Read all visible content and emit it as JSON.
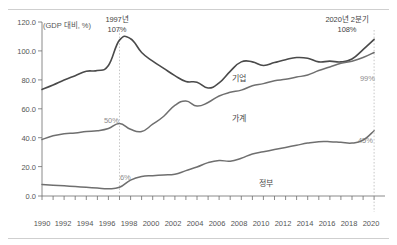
{
  "chart_data": {
    "type": "line",
    "title": "",
    "unit_label": "(GDP 대비, %)",
    "xlabel": "",
    "ylabel": "",
    "ylim": [
      0,
      120
    ],
    "yticks": [
      "0.0",
      "20.0",
      "40.0",
      "60.0",
      "80.0",
      "100.0",
      "120.0"
    ],
    "xlim": [
      1990,
      2020
    ],
    "xticks": [
      "1990",
      "1992",
      "1994",
      "1996",
      "1998",
      "2000",
      "2002",
      "2004",
      "2006",
      "2008",
      "2010",
      "2012",
      "2014",
      "2016",
      "2018",
      "2020"
    ],
    "grid": false,
    "legend_position": "inline-labels",
    "x": [
      1990,
      1991,
      1992,
      1993,
      1994,
      1995,
      1996,
      1997,
      1998,
      1999,
      2000,
      2001,
      2002,
      2003,
      2004,
      2005,
      2006,
      2007,
      2008,
      2009,
      2010,
      2011,
      2012,
      2013,
      2014,
      2015,
      2016,
      2017,
      2018,
      2019,
      2020
    ],
    "series": [
      {
        "name": "기업",
        "color": "#4a4a4a",
        "values": [
          73.5,
          76.5,
          80.0,
          83.0,
          86.0,
          86.5,
          90.0,
          107.5,
          108.5,
          99.0,
          93.0,
          88.0,
          83.0,
          79.0,
          78.5,
          74.5,
          78.0,
          86.0,
          92.5,
          92.5,
          90.0,
          92.0,
          94.0,
          95.5,
          95.0,
          92.5,
          93.0,
          92.5,
          94.5,
          101.0,
          108.0
        ]
      },
      {
        "name": "가계",
        "color": "#6f6f6f",
        "values": [
          39.0,
          41.5,
          43.0,
          43.5,
          44.5,
          45.0,
          46.5,
          50.0,
          46.0,
          44.5,
          49.5,
          55.0,
          62.5,
          65.5,
          62.0,
          64.5,
          69.0,
          71.5,
          73.0,
          76.0,
          77.5,
          79.5,
          80.5,
          82.0,
          83.5,
          86.5,
          89.0,
          91.5,
          93.0,
          95.5,
          99.0
        ]
      },
      {
        "name": "정부",
        "color": "#6f6f6f",
        "values": [
          8.0,
          7.5,
          7.0,
          6.5,
          6.0,
          5.5,
          5.0,
          6.0,
          11.0,
          13.5,
          14.0,
          14.5,
          15.0,
          17.5,
          20.0,
          23.0,
          24.5,
          24.0,
          26.0,
          29.0,
          30.5,
          32.0,
          33.5,
          35.0,
          36.5,
          37.5,
          37.5,
          37.0,
          36.5,
          38.5,
          45.0
        ]
      }
    ],
    "reference_lines": [
      {
        "x": 1997,
        "style": "dotted"
      },
      {
        "x": 2020,
        "style": "dotted"
      }
    ],
    "annotations": [
      {
        "id": "peak-1997",
        "text_line1": "1997년",
        "text_line2": "107%",
        "x": 1997
      },
      {
        "id": "latest-2020",
        "text_line1": "2020년 2분기",
        "text_line2": "108%",
        "x": 2020
      },
      {
        "id": "household-1997",
        "text": "50%",
        "x": 1997
      },
      {
        "id": "government-1997",
        "text": "6%",
        "x": 1997
      },
      {
        "id": "household-2020",
        "text": "99%",
        "x": 2020
      },
      {
        "id": "government-2020",
        "text": "45%",
        "x": 2020
      }
    ]
  },
  "labels": {
    "y": {
      "t120": "120.0",
      "t100": "100.0",
      "t80": "80.0",
      "t60": "60.0",
      "t40": "40.0",
      "t20": "20.0",
      "t0": "0.0"
    },
    "x": {
      "y1990": "1990",
      "y1992": "1992",
      "y1994": "1994",
      "y1996": "1996",
      "y1998": "1998",
      "y2000": "2000",
      "y2002": "2002",
      "y2004": "2004",
      "y2006": "2006",
      "y2008": "2008",
      "y2010": "2010",
      "y2012": "2012",
      "y2014": "2014",
      "y2016": "2016",
      "y2018": "2018",
      "y2020": "2020"
    },
    "unit": "(GDP 대비, %)",
    "series": {
      "corporate": "기업",
      "household": "가계",
      "government": "정부"
    },
    "annotations": {
      "peak_year": "1997년",
      "peak_value": "107%",
      "latest_period": "2020년 2분기",
      "latest_value": "108%",
      "household_1997": "50%",
      "government_1997": "6%",
      "household_2020": "99%",
      "government_2020": "45%"
    }
  }
}
